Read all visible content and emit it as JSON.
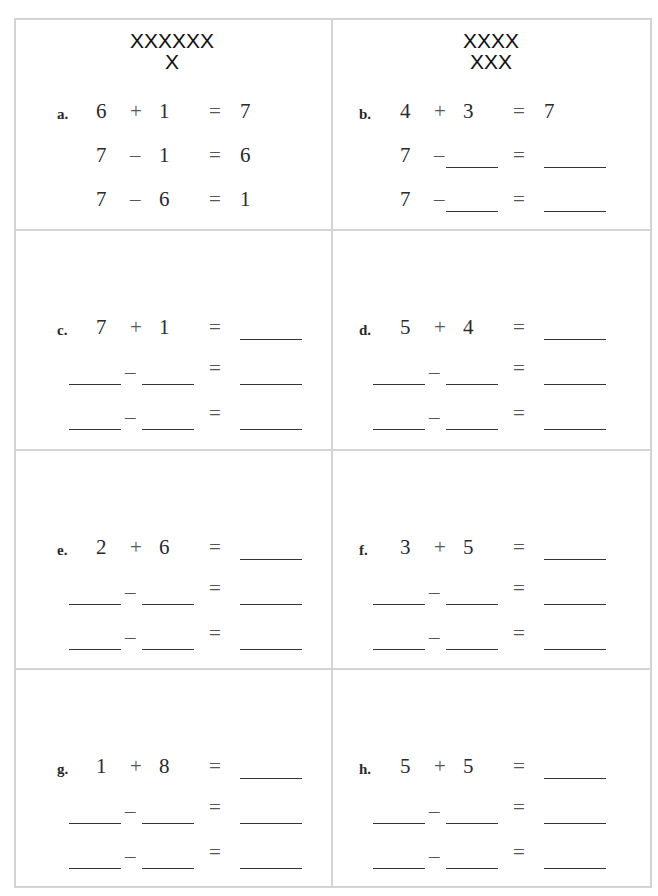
{
  "worksheet": {
    "problems": [
      {
        "id": "a",
        "label": "a.",
        "model": [
          "XXXXXX",
          "X"
        ],
        "rows": [
          [
            "6",
            "+",
            "1",
            "=",
            "7"
          ],
          [
            "7",
            "–",
            "1",
            "=",
            "6"
          ],
          [
            "7",
            "–",
            "6",
            "=",
            "1"
          ]
        ]
      },
      {
        "id": "b",
        "label": "b.",
        "model": [
          "XXXX",
          "XXX"
        ],
        "rows": [
          [
            "4",
            "+",
            "3",
            "=",
            "7"
          ],
          [
            "7",
            "–",
            "",
            "=",
            ""
          ],
          [
            "7",
            "–",
            "",
            "=",
            ""
          ]
        ]
      },
      {
        "id": "c",
        "label": "c.",
        "model": [],
        "rows": [
          [
            "7",
            "+",
            "1",
            "=",
            ""
          ],
          [
            "",
            "–",
            "",
            "=",
            ""
          ],
          [
            "",
            "–",
            "",
            "=",
            ""
          ]
        ]
      },
      {
        "id": "d",
        "label": "d.",
        "model": [],
        "rows": [
          [
            "5",
            "+",
            "4",
            "=",
            ""
          ],
          [
            "",
            "–",
            "",
            "=",
            ""
          ],
          [
            "",
            "–",
            "",
            "=",
            ""
          ]
        ]
      },
      {
        "id": "e",
        "label": "e.",
        "model": [],
        "rows": [
          [
            "2",
            "+",
            "6",
            "=",
            ""
          ],
          [
            "",
            "–",
            "",
            "=",
            ""
          ],
          [
            "",
            "–",
            "",
            "=",
            ""
          ]
        ]
      },
      {
        "id": "f",
        "label": "f.",
        "model": [],
        "rows": [
          [
            "3",
            "+",
            "5",
            "=",
            ""
          ],
          [
            "",
            "–",
            "",
            "=",
            ""
          ],
          [
            "",
            "–",
            "",
            "=",
            ""
          ]
        ]
      },
      {
        "id": "g",
        "label": "g.",
        "model": [],
        "rows": [
          [
            "1",
            "+",
            "8",
            "=",
            ""
          ],
          [
            "",
            "–",
            "",
            "=",
            ""
          ],
          [
            "",
            "–",
            "",
            "=",
            ""
          ]
        ]
      },
      {
        "id": "h",
        "label": "h.",
        "model": [],
        "rows": [
          [
            "5",
            "+",
            "5",
            "=",
            ""
          ],
          [
            "",
            "–",
            "",
            "=",
            ""
          ],
          [
            "",
            "–",
            "",
            "=",
            ""
          ]
        ]
      }
    ]
  }
}
